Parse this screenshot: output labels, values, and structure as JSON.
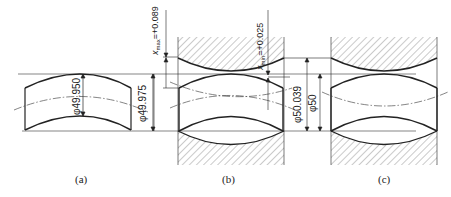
{
  "figure": {
    "panels": [
      {
        "id": "a",
        "caption": "(a)",
        "part": "shaft",
        "dimensions": [
          {
            "label": "φ49.950"
          },
          {
            "label": "φ49.975"
          }
        ]
      },
      {
        "id": "b",
        "caption": "(b)",
        "part": "shaft in hole, maximum clearance",
        "dimensions": [
          {
            "label": "x_max=+0.089",
            "symbol": "x",
            "subscript": "max",
            "value": "=+0.089"
          },
          {
            "label": "x_min=+0.025",
            "symbol": "x",
            "subscript": "min",
            "value": "=+0.025"
          },
          {
            "label": "φ50.039"
          }
        ]
      },
      {
        "id": "c",
        "caption": "(c)",
        "part": "shaft in hole, minimum clearance",
        "dimensions": [
          {
            "label": "φ50"
          }
        ]
      }
    ],
    "colors": {
      "line": "#222222",
      "hatch": "#555555",
      "background": "#ffffff"
    }
  }
}
